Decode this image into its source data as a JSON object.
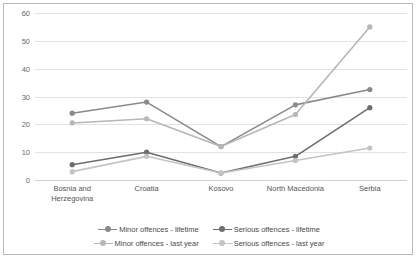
{
  "chart_data": {
    "type": "line",
    "title": "",
    "subtitle": "",
    "xlabel": "",
    "ylabel": "",
    "categories": [
      "Bosnia and\nHerzegovina",
      "Croatia",
      "Kosovo",
      "North Macedonia",
      "Serbia"
    ],
    "yticks": [
      0,
      10,
      20,
      30,
      40,
      50,
      60
    ],
    "ylim": [
      0,
      60
    ],
    "grid": true,
    "legend_position": "bottom",
    "series": [
      {
        "name": "Minor offences - lifetime",
        "color": "#8a8a8a",
        "values": [
          24,
          28,
          12,
          27,
          32.5
        ]
      },
      {
        "name": "Serious offences - lifetime",
        "color": "#6e6e6e",
        "values": [
          5.5,
          10,
          2.5,
          8.5,
          26
        ]
      },
      {
        "name": "Minor offences - last year",
        "color": "#b7b7b7",
        "values": [
          20.5,
          22,
          12,
          23.5,
          55
        ]
      },
      {
        "name": "Serious offences - last year",
        "color": "#c4c4c4",
        "values": [
          3,
          8.5,
          2.5,
          7,
          11.5
        ]
      }
    ]
  },
  "legend": {
    "rows": [
      [
        {
          "label": "Minor offences - lifetime",
          "color": "#8a8a8a"
        },
        {
          "label": "Serious offences - lifetime",
          "color": "#6e6e6e"
        }
      ],
      [
        {
          "label": "Minor offences - last year",
          "color": "#b7b7b7"
        },
        {
          "label": "Serious offences - last year",
          "color": "#c4c4c4"
        }
      ]
    ]
  },
  "colors": {
    "grid": "#e2e2e2",
    "axis": "#cfcfcf",
    "frame": "#b9b9b9",
    "tick_text": "#6a6a6a",
    "label_text": "#555555",
    "background": "#ffffff"
  }
}
